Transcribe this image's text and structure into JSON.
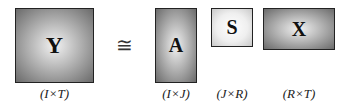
{
  "equation": {
    "operator": "≅",
    "matrices": [
      {
        "symbol": "Y",
        "dims": "(I×T)"
      },
      {
        "symbol": "A",
        "dims": "(I×J)"
      },
      {
        "symbol": "S",
        "dims": "(J×R)"
      },
      {
        "symbol": "X",
        "dims": "(R×T)"
      }
    ]
  }
}
